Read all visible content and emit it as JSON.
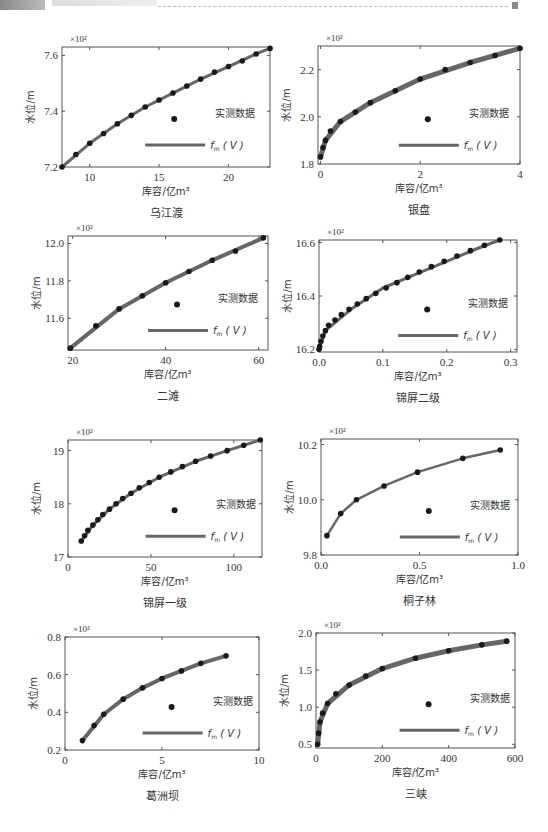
{
  "header": {
    "decoration": "page-header"
  },
  "legend": {
    "points_label": "实测数据",
    "line_label": "f_m (V)",
    "line_label_main": "f",
    "line_label_sub": "m",
    "line_label_arg": "( V )"
  },
  "axis_common": {
    "xlabel": "库容/亿m³",
    "ylabel": "水位/m",
    "multiplier": "×10²"
  },
  "colors": {
    "marker": "#1a1a1a",
    "line": "#666666",
    "axis": "#555555"
  },
  "chart_data": [
    {
      "type": "line",
      "title": "乌江渡",
      "xlabel": "库容/亿m³",
      "ylabel": "水位/m",
      "y_multiplier": "×10²",
      "xlim": [
        8,
        23
      ],
      "ylim": [
        7.2,
        7.63
      ],
      "xticks": [
        10,
        15,
        20
      ],
      "yticks": [
        7.2,
        7.4,
        7.6
      ],
      "series": [
        {
          "name": "实测数据",
          "style": "markers",
          "x": [
            8,
            9,
            10,
            11,
            12,
            13,
            14,
            15,
            16,
            17,
            18,
            19,
            20,
            21,
            22,
            23
          ],
          "y": [
            7.2,
            7.245,
            7.285,
            7.32,
            7.355,
            7.385,
            7.415,
            7.44,
            7.465,
            7.49,
            7.515,
            7.54,
            7.56,
            7.58,
            7.605,
            7.625
          ]
        },
        {
          "name": "f_m(V)",
          "style": "line",
          "x": [
            8,
            10,
            12,
            14,
            16,
            18,
            20,
            22,
            23
          ],
          "y": [
            7.2,
            7.285,
            7.355,
            7.415,
            7.465,
            7.515,
            7.56,
            7.605,
            7.625
          ]
        }
      ]
    },
    {
      "type": "line",
      "title": "银盘",
      "xlabel": "库容/亿m³",
      "ylabel": "水位/m",
      "y_multiplier": "×10²",
      "xlim": [
        -0.05,
        4
      ],
      "ylim": [
        1.8,
        2.3
      ],
      "xticks": [
        0,
        2,
        4
      ],
      "yticks": [
        1.8,
        2.0,
        2.2
      ],
      "series": [
        {
          "name": "实测数据",
          "style": "markers",
          "x": [
            0,
            0.05,
            0.1,
            0.2,
            0.4,
            0.7,
            1,
            1.5,
            2,
            2.5,
            3,
            3.5,
            4
          ],
          "y": [
            1.83,
            1.87,
            1.9,
            1.94,
            1.98,
            2.02,
            2.06,
            2.11,
            2.16,
            2.2,
            2.23,
            2.26,
            2.29
          ]
        },
        {
          "name": "f_m(V)",
          "style": "line",
          "x": [
            0,
            0.1,
            0.4,
            1,
            2,
            3,
            4
          ],
          "y": [
            1.83,
            1.9,
            1.98,
            2.06,
            2.16,
            2.23,
            2.29
          ]
        }
      ]
    },
    {
      "type": "line",
      "title": "二滩",
      "xlabel": "库容/亿m³",
      "ylabel": "水位/m",
      "y_multiplier": "×10²",
      "xlim": [
        19,
        62
      ],
      "ylim": [
        11.43,
        12.04
      ],
      "xticks": [
        20,
        40,
        60
      ],
      "yticks": [
        11.6,
        11.8,
        12.0
      ],
      "series": [
        {
          "name": "实测数据",
          "style": "markers",
          "x": [
            19.5,
            25,
            30,
            35,
            40,
            45,
            50,
            55,
            61
          ],
          "y": [
            11.44,
            11.56,
            11.65,
            11.72,
            11.79,
            11.85,
            11.91,
            11.96,
            12.03
          ]
        },
        {
          "name": "f_m(V)",
          "style": "line",
          "x": [
            19.5,
            30,
            40,
            50,
            61
          ],
          "y": [
            11.44,
            11.65,
            11.79,
            11.91,
            12.03
          ]
        }
      ]
    },
    {
      "type": "line",
      "title": "锦屏二级",
      "xlabel": "库容/亿m³",
      "ylabel": "水位/m",
      "y_multiplier": "×10²",
      "xlim": [
        0,
        0.31
      ],
      "ylim": [
        16.19,
        16.61
      ],
      "xticks": [
        0,
        0.1,
        0.2,
        0.3
      ],
      "yticks": [
        16.2,
        16.4,
        16.6
      ],
      "series": [
        {
          "name": "实测数据",
          "style": "markers",
          "x": [
            0,
            0.001,
            0.003,
            0.006,
            0.01,
            0.015,
            0.025,
            0.035,
            0.047,
            0.06,
            0.074,
            0.089,
            0.105,
            0.122,
            0.139,
            0.157,
            0.176,
            0.196,
            0.216,
            0.237,
            0.259,
            0.283
          ],
          "y": [
            16.2,
            16.21,
            16.23,
            16.25,
            16.27,
            16.29,
            16.31,
            16.33,
            16.35,
            16.37,
            16.39,
            16.41,
            16.43,
            16.45,
            16.47,
            16.49,
            16.51,
            16.53,
            16.55,
            16.57,
            16.59,
            16.61
          ]
        },
        {
          "name": "f_m(V)",
          "style": "line",
          "x": [
            0,
            0.01,
            0.05,
            0.1,
            0.15,
            0.2,
            0.25,
            0.283
          ],
          "y": [
            16.2,
            16.27,
            16.35,
            16.43,
            16.48,
            16.53,
            16.58,
            16.61
          ]
        }
      ]
    },
    {
      "type": "line",
      "title": "锦屏一级",
      "xlabel": "库容/亿m³",
      "ylabel": "水位/m",
      "y_multiplier": "×10²",
      "xlim": [
        0,
        117
      ],
      "ylim": [
        17.0,
        19.2
      ],
      "xticks": [
        0,
        50,
        100
      ],
      "yticks": [
        17.0,
        18.0,
        19.0
      ],
      "series": [
        {
          "name": "实测数据",
          "style": "markers",
          "x": [
            8,
            10,
            12,
            15,
            18,
            21,
            25,
            29,
            33,
            38,
            43,
            49,
            55,
            62,
            69,
            77,
            86,
            96,
            106,
            116
          ],
          "y": [
            17.3,
            17.4,
            17.5,
            17.6,
            17.7,
            17.8,
            17.9,
            18.0,
            18.1,
            18.2,
            18.3,
            18.4,
            18.5,
            18.6,
            18.7,
            18.8,
            18.9,
            19.0,
            19.1,
            19.2
          ]
        },
        {
          "name": "f_m(V)",
          "style": "line",
          "x": [
            8,
            15,
            25,
            38,
            55,
            77,
            96,
            116
          ],
          "y": [
            17.3,
            17.6,
            17.9,
            18.2,
            18.5,
            18.8,
            19.0,
            19.2
          ]
        }
      ]
    },
    {
      "type": "line",
      "title": "桐子林",
      "xlabel": "库容/亿m³",
      "ylabel": "水位/m",
      "y_multiplier": "×10²",
      "xlim": [
        0,
        1
      ],
      "ylim": [
        9.8,
        10.22
      ],
      "xticks": [
        0,
        0.5,
        1
      ],
      "yticks": [
        9.8,
        10.0,
        10.2
      ],
      "series": [
        {
          "name": "实测数据",
          "style": "markers",
          "x": [
            0.03,
            0.1,
            0.18,
            0.32,
            0.49,
            0.72,
            0.91
          ],
          "y": [
            9.87,
            9.95,
            10.0,
            10.05,
            10.1,
            10.15,
            10.18
          ]
        },
        {
          "name": "f_m(V)",
          "style": "line",
          "x": [
            0.03,
            0.1,
            0.18,
            0.32,
            0.49,
            0.72,
            0.91
          ],
          "y": [
            9.87,
            9.95,
            10.0,
            10.05,
            10.1,
            10.15,
            10.18
          ]
        }
      ]
    },
    {
      "type": "line",
      "title": "葛洲坝",
      "xlabel": "库容/亿m³",
      "ylabel": "水位/m",
      "y_multiplier": "×10²",
      "xlim": [
        0,
        10
      ],
      "ylim": [
        0.2,
        0.8
      ],
      "xticks": [
        0,
        5,
        10
      ],
      "yticks": [
        0.2,
        0.4,
        0.6,
        0.8
      ],
      "series": [
        {
          "name": "实测数据",
          "style": "markers",
          "x": [
            0.9,
            1.5,
            2,
            3,
            4,
            5,
            6,
            7,
            8.3
          ],
          "y": [
            0.25,
            0.33,
            0.39,
            0.47,
            0.53,
            0.58,
            0.62,
            0.66,
            0.7
          ]
        },
        {
          "name": "f_m(V)",
          "style": "line",
          "x": [
            0.9,
            2,
            3,
            4,
            5,
            6,
            7,
            8.3
          ],
          "y": [
            0.25,
            0.39,
            0.47,
            0.53,
            0.58,
            0.62,
            0.66,
            0.7
          ]
        }
      ]
    },
    {
      "type": "line",
      "title": "三峡",
      "xlabel": "库容/亿m³",
      "ylabel": "水位/m",
      "y_multiplier": "×10²",
      "xlim": [
        0,
        600
      ],
      "ylim": [
        0.45,
        2.0
      ],
      "xticks": [
        0,
        200,
        400,
        600
      ],
      "yticks": [
        0.5,
        1.0,
        1.5,
        2.0
      ],
      "series": [
        {
          "name": "实测数据",
          "style": "markers",
          "x": [
            5,
            8,
            12,
            20,
            35,
            60,
            100,
            150,
            200,
            300,
            400,
            500,
            575
          ],
          "y": [
            0.5,
            0.65,
            0.8,
            0.92,
            1.05,
            1.18,
            1.3,
            1.42,
            1.52,
            1.66,
            1.76,
            1.84,
            1.89
          ]
        },
        {
          "name": "f_m(V)",
          "style": "line",
          "x": [
            5,
            12,
            35,
            100,
            200,
            300,
            400,
            500,
            575
          ],
          "y": [
            0.5,
            0.8,
            1.05,
            1.3,
            1.52,
            1.66,
            1.76,
            1.84,
            1.89
          ]
        }
      ]
    }
  ]
}
